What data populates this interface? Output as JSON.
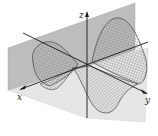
{
  "figure": {
    "axes": {
      "x_label": "x",
      "y_label": "y",
      "z_label": "z"
    },
    "colors": {
      "plane_upper": "#b9b9b9",
      "plane_lower": "#e4e4e4",
      "mesh": "#555555",
      "axis": "#1a1a1a"
    }
  }
}
